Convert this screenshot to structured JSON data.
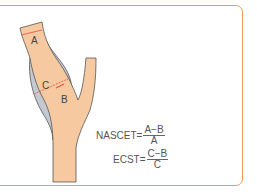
{
  "diagram": {
    "labels": {
      "a": "A",
      "b": "B",
      "c": "C"
    },
    "colors": {
      "frame": "#ef9a5a",
      "vessel": "#f6c9a0",
      "plaque": "#c4c9d2",
      "outline": "#555555",
      "measure": "#e0504a"
    }
  },
  "formulas": {
    "nascet": {
      "name": "NASCET",
      "eq": "=",
      "numerator": "A−B",
      "denominator": "A"
    },
    "ecst": {
      "name": "ECST",
      "eq": "=",
      "numerator": "C−B",
      "denominator": "C"
    }
  }
}
